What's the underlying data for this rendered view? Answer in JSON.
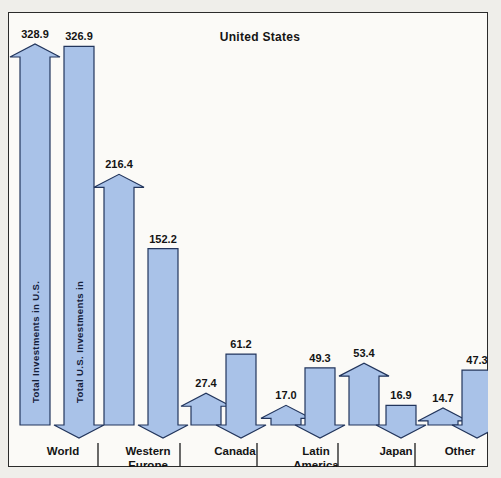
{
  "frame": {
    "background": "#fbfaf7",
    "page_background": "#efeeea",
    "border_color": "#2b2b2b"
  },
  "title": "United States",
  "colors": {
    "bar_fill": "#a9c2e8",
    "bar_stroke": "#22355c",
    "text": "#141414"
  },
  "series_labels": {
    "inbound": "Total Investments in U.S.",
    "outbound": "Total U.S. Investments in"
  },
  "chart_data": {
    "type": "bar",
    "title": "United States",
    "xlabel": "",
    "ylabel": "",
    "ylim": [
      0,
      340
    ],
    "grid": false,
    "legend_position": "inside-bars",
    "categories": [
      "World",
      "Western Europe",
      "Canada",
      "Latin America",
      "Japan",
      "Other"
    ],
    "series": [
      {
        "name": "Total Investments in U.S.",
        "marker": "up-arrow-top",
        "values": [
          328.9,
          216.4,
          27.4,
          17.0,
          53.4,
          14.7
        ]
      },
      {
        "name": "Total U.S. Investments in",
        "marker": "down-arrow-bottom",
        "values": [
          326.9,
          152.2,
          61.2,
          49.3,
          16.9,
          47.3
        ]
      }
    ],
    "value_labels": [
      "328.9",
      "326.9",
      "216.4",
      "152.2",
      "27.4",
      "61.2",
      "17.0",
      "49.3",
      "53.4",
      "16.9",
      "14.7",
      "47.3"
    ]
  },
  "category_lines": [
    {
      "line1": "World",
      "line2": ""
    },
    {
      "line1": "Western",
      "line2": "Europe"
    },
    {
      "line1": "Canada",
      "line2": ""
    },
    {
      "line1": "Latin",
      "line2": "America"
    },
    {
      "line1": "Japan",
      "line2": ""
    },
    {
      "line1": "Other",
      "line2": ""
    }
  ]
}
